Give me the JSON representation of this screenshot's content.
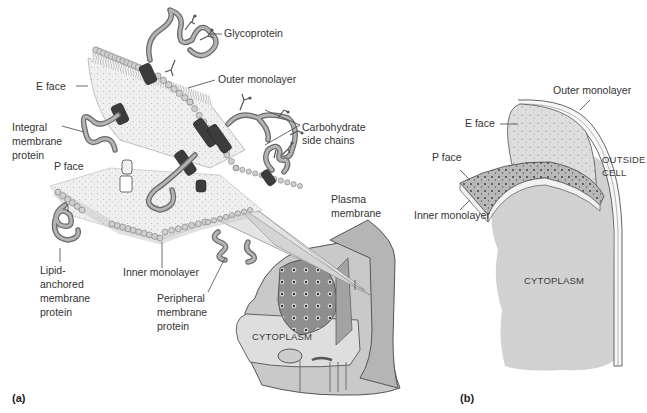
{
  "figure": {
    "panel_a": {
      "panel_label": "(a)",
      "labels": {
        "glycoprotein": "Glycoprotein",
        "e_face": "E face",
        "outer_monolayer": "Outer monolayer",
        "integral_1": "Integral",
        "integral_2": "membrane",
        "integral_3": "protein",
        "carb_1": "Carbohydrate",
        "carb_2": "side chains",
        "p_face": "P face",
        "plasma_1": "Plasma",
        "plasma_2": "membrane",
        "lipid_1": "Lipid-",
        "lipid_2": "anchored",
        "lipid_3": "membrane",
        "lipid_4": "protein",
        "inner_monolayer": "Inner monolayer",
        "peripheral_1": "Peripheral",
        "peripheral_2": "membrane",
        "peripheral_3": "protein",
        "cytoplasm": "CYTOPLASM"
      }
    },
    "panel_b": {
      "panel_label": "(b)",
      "labels": {
        "outer_monolayer": "Outer monolayer",
        "e_face": "E face",
        "p_face": "P face",
        "outside_1": "OUTSIDE",
        "outside_2": "CELL",
        "inner_monolayer": "Inner monolayer",
        "cytoplasm": "CYTOPLASM"
      }
    }
  }
}
